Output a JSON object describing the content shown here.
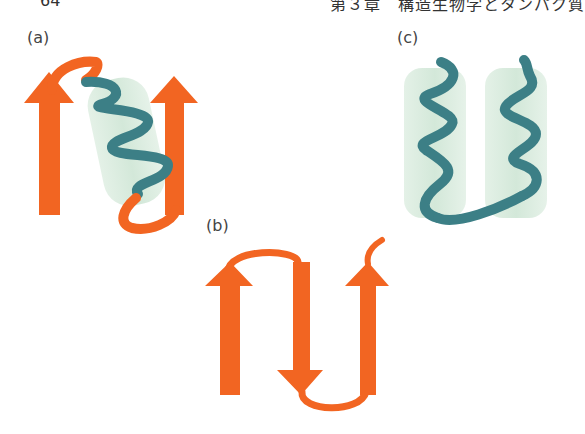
{
  "header": {
    "page_number": "64",
    "chapter_title": "第３章　構造生物学とタンパク質"
  },
  "panels": [
    {
      "id": "a",
      "label": "(a)",
      "description": "beta-alpha-beta motif: two beta strands (arrows) connected via an alpha helix"
    },
    {
      "id": "b",
      "label": "(b)",
      "description": "beta-meander: three antiparallel beta strands connected by hairpin loops"
    },
    {
      "id": "c",
      "label": "(c)",
      "description": "helix-loop-helix: two alpha helices (cylinders) connected by a loop"
    }
  ],
  "colors": {
    "strand": "#F26522",
    "helix": "#3C7F86",
    "cylinder": "#DCEEE1"
  }
}
